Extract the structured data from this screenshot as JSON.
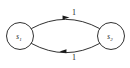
{
  "diagram": {
    "type": "state-transition-graph",
    "background_color": "#ffffff",
    "stroke_color": "#1a1a1a",
    "nodes": [
      {
        "id": "s1",
        "label_base": "s",
        "label_sub": "1",
        "cx": 20,
        "cy": 36,
        "r": 13.5
      },
      {
        "id": "s2",
        "label_base": "s",
        "label_sub": "2",
        "cx": 111,
        "cy": 36,
        "r": 13.5
      }
    ],
    "edges": [
      {
        "id": "s1-to-s2",
        "from": "s1",
        "to": "s2",
        "label": "1",
        "direction": "right",
        "curve": "top",
        "path": "M 31.5 28.5 Q 65.5 10 99.5 28.5",
        "arrow_points": "62.5,15.6 69.5,17.4 62.6,19.6",
        "label_x": 74,
        "label_y": 12
      },
      {
        "id": "s2-to-s1",
        "from": "s2",
        "to": "s1",
        "label": "1",
        "direction": "left",
        "curve": "bottom",
        "path": "M 99.5 43.5 Q 65.5 62 31.5 43.5",
        "arrow_points": "66.5,49.2 59.5,51.4 66.4,53.2",
        "label_x": 74,
        "label_y": 57
      }
    ]
  }
}
